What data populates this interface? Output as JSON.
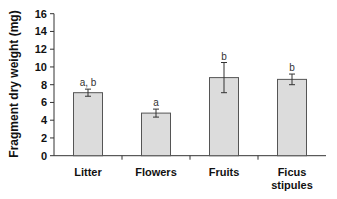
{
  "chart_data": {
    "type": "bar",
    "title": "",
    "xlabel": "",
    "ylabel": "Fragment dry weight (mg)",
    "ylim": [
      0,
      16
    ],
    "yticks": [
      0,
      2,
      4,
      6,
      8,
      10,
      12,
      14,
      16
    ],
    "grid": false,
    "legend": null,
    "categories": [
      "Litter",
      "Flowers",
      "Fruits",
      "Ficus stipules"
    ],
    "category_label_lines": [
      [
        "Litter"
      ],
      [
        "Flowers"
      ],
      [
        "Fruits"
      ],
      [
        "Ficus",
        "stipules"
      ]
    ],
    "values": [
      7.1,
      4.8,
      8.8,
      8.6
    ],
    "error": [
      0.4,
      0.45,
      1.7,
      0.6
    ],
    "annotations": [
      "a, b",
      "a",
      "b",
      "b"
    ],
    "bar_color": "#dcdcdc",
    "bar_edge_color": "#555555"
  }
}
